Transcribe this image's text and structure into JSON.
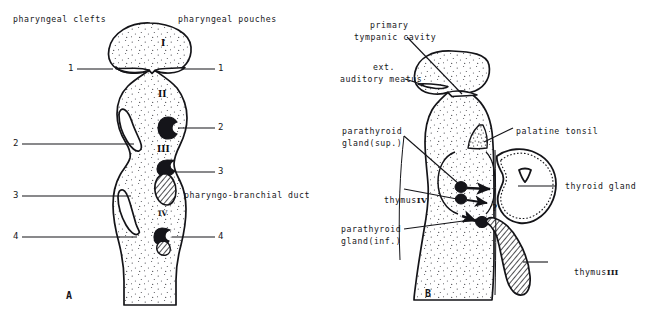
{
  "figure": {
    "background": "#ffffff",
    "ink": "#111114",
    "stipple": "#2a2a2e"
  },
  "panel_a": {
    "letter": "A",
    "header_left": "pharyngeal clefts",
    "header_right": "pharyngeal pouches",
    "duct_label": "pharyngo-branchial duct",
    "arch_numerals": [
      "I",
      "II",
      "III",
      "IV"
    ],
    "cleft_numbers": [
      "1",
      "2",
      "3",
      "4"
    ],
    "pouch_numbers": [
      "1",
      "2",
      "3",
      "4"
    ]
  },
  "panel_b": {
    "letter": "B",
    "labels": {
      "primary_tympanic_cavity_line1": "primary",
      "primary_tympanic_cavity_line2": "tympanic cavity",
      "ext_auditory_meatus_line1": "ext.",
      "ext_auditory_meatus_line2": "auditory meatus",
      "parathyroid_sup_line1": "parathyroid",
      "parathyroid_sup_line2": "gland(sup.)",
      "parathyroid_inf_line1": "parathyroid",
      "parathyroid_inf_line2": "gland(inf.)",
      "palatine_tonsil": "palatine tonsil",
      "thyroid_gland": "thyroid gland",
      "thymus_iv_text": "thymus",
      "thymus_iv_numeral": "IV",
      "thymus_iii_text": "thymus",
      "thymus_iii_numeral": "III",
      "question_mark": "?"
    }
  }
}
